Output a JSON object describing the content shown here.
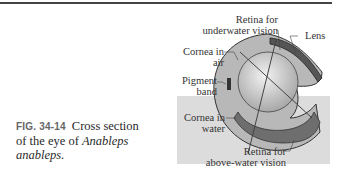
{
  "figure": {
    "number": "FIG. 34-14",
    "caption_plain": "Cross section of the eye of ",
    "caption_italic": "Anableps anableps.",
    "caption_line2_plain": "of the eye of ",
    "caption_line1": "Cross section",
    "genus": "Anableps",
    "species": "anableps."
  },
  "labels": {
    "retina_under_1": "Retina for",
    "retina_under_2": "underwater vision",
    "lens": "Lens",
    "cornea_air_1": "Cornea in",
    "cornea_air_2": "air",
    "pigment_1": "Pigment",
    "pigment_2": "band",
    "cornea_water_1": "Cornea in",
    "cornea_water_2": "water",
    "retina_above_1": "Retina for",
    "retina_above_2": "above-water vision"
  },
  "colors": {
    "water": "#dcdcdc",
    "eye_body": "#b0b0b0",
    "retina": "#6e6e6e",
    "lens": "#c8c8c8"
  }
}
